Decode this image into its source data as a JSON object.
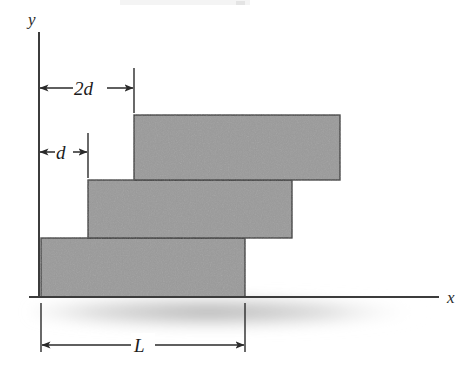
{
  "figure": {
    "scan_artifact_text": "",
    "axes": {
      "y_label": "y",
      "x_label": "x"
    },
    "dimensions": [
      {
        "key": "top_offset",
        "label": "2d",
        "from_x": 39,
        "to_x": 134,
        "y": 88
      },
      {
        "key": "middle_offset",
        "label": "d",
        "from_x": 39,
        "to_x": 88,
        "y": 152
      },
      {
        "key": "block_length",
        "label": "L",
        "from_x": 41,
        "to_x": 245,
        "y": 345
      }
    ],
    "blocks": [
      {
        "name": "bottom-block",
        "x": 41,
        "y": 238,
        "width": 204,
        "height": 59
      },
      {
        "name": "middle-block",
        "x": 88,
        "y": 180,
        "width": 204,
        "height": 58
      },
      {
        "name": "top-block",
        "x": 134,
        "y": 115,
        "width": 206,
        "height": 65
      }
    ],
    "colors": {
      "block_fill": "#9a9a9a",
      "block_stroke": "#3a3a3a",
      "axis": "#3c3c3c",
      "dimension": "#2a2a2a",
      "shadow": "#b8b8b8",
      "background": "#ffffff"
    },
    "ground": {
      "y": 297,
      "from_x": 30,
      "to_x": 440
    },
    "y_axis": {
      "x": 39,
      "from_y": 33,
      "to_y": 297
    }
  }
}
